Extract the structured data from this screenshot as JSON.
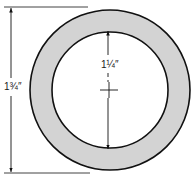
{
  "diagram": {
    "type": "washer-dimension-drawing",
    "colors": {
      "ring_fill": "#d3d3d3",
      "stroke": "#111111",
      "background": "#ffffff"
    },
    "outer_diameter": {
      "label": "1¾″"
    },
    "inner_diameter": {
      "label": "1¼″"
    }
  }
}
